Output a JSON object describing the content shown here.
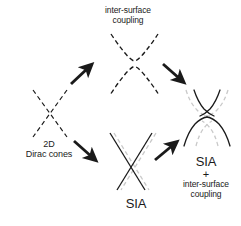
{
  "figure": {
    "title_present": false,
    "background_color": "#ffffff",
    "stroke_dark": "#1a1a1a",
    "stroke_gray": "#c8c8c8",
    "labels": {
      "coupling_line1": "inter-surface",
      "coupling_line2": "coupling",
      "dirac_line1": "2D",
      "dirac_line2": "Dirac cones",
      "sia": "SIA",
      "final_line1": "SIA",
      "final_plus": "+",
      "final_line3": "inter-surface",
      "final_line4": "coupling"
    },
    "panels": [
      {
        "name": "dirac-cones-panel",
        "description": "two crossing dashed straight lines forming an X",
        "style": "dashed-dark"
      },
      {
        "name": "inter-surface-coupling-panel",
        "description": "gapped bands: dashed upper U branch and dashed lower inverted-U branch",
        "style": "dashed-dark"
      },
      {
        "name": "sia-panel",
        "description": "solid dark X overlapping a light gray dashed X, horizontally offset",
        "style": "solid-dark-plus-dashed-gray"
      },
      {
        "name": "sia-plus-coupling-panel",
        "description": "gapped and spin-split bands: solid dark crossing branches with light gray dashed counterparts",
        "style": "solid-dark-plus-dashed-gray"
      }
    ],
    "arrows": [
      {
        "name": "arrow-dirac-to-coupling",
        "direction": "up-right"
      },
      {
        "name": "arrow-coupling-to-final",
        "direction": "down-right"
      },
      {
        "name": "arrow-dirac-to-sia",
        "direction": "down-right"
      },
      {
        "name": "arrow-sia-to-final",
        "direction": "up-right"
      }
    ]
  }
}
